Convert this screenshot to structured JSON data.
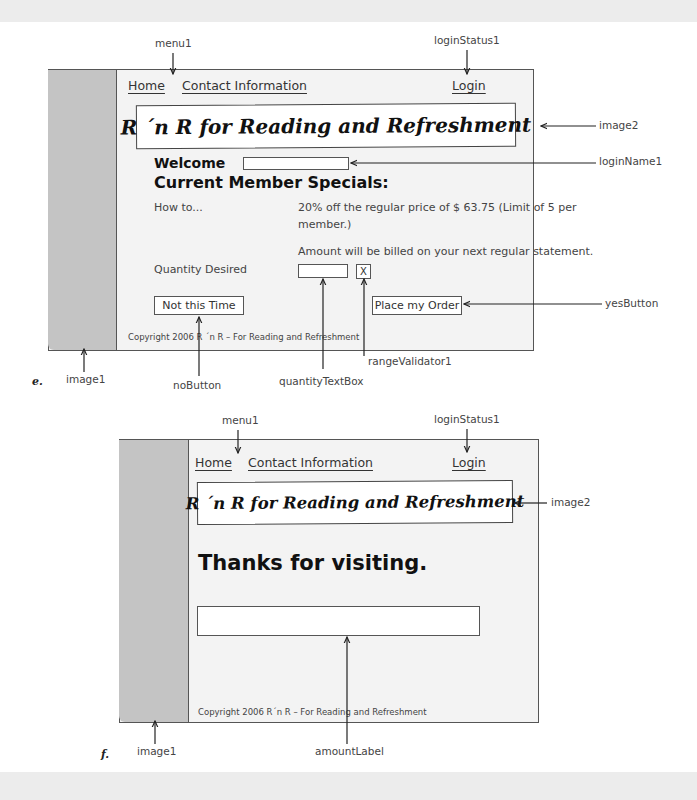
{
  "figure_e": {
    "label": "e.",
    "menu": {
      "home": "Home",
      "contact": "Contact Information"
    },
    "login_status": "Login",
    "banner_title": "R ´n R for Reading and Refreshment",
    "welcome_label": "Welcome",
    "login_name_value": "",
    "specials_heading": "Current Member Specials:",
    "how_to": "How to...",
    "offer_line1": "20% off the regular price of $ 63.75 (Limit of 5 per",
    "offer_line2": "member.)",
    "billing_note": "Amount will be billed on your next regular statement.",
    "quantity_label": "Quantity Desired",
    "quantity_value": "",
    "validator_text": "X",
    "no_button": "Not this Time",
    "yes_button": "Place my Order",
    "copyright": "Copyright 2006 R ´n R – For Reading and Refreshment",
    "callouts": {
      "menu": "menu1",
      "login_status": "loginStatus1",
      "image2": "image2",
      "login_name": "loginName1",
      "yes_button": "yesButton",
      "range_validator": "rangeValidator1",
      "image1": "image1",
      "no_button": "noButton",
      "quantity_box": "quantityTextBox"
    }
  },
  "figure_f": {
    "label": "f.",
    "menu": {
      "home": "Home",
      "contact": "Contact Information"
    },
    "login_status": "Login",
    "banner_title": "R ´n R for Reading and Refreshment",
    "thanks_heading": "Thanks for visiting.",
    "amount_label_value": "",
    "copyright": "Copyright 2006 R´n R – For Reading and Refreshment",
    "callouts": {
      "menu": "menu1",
      "login_status": "loginStatus1",
      "image2": "image2",
      "image1": "image1",
      "amount_label": "amountLabel"
    }
  }
}
